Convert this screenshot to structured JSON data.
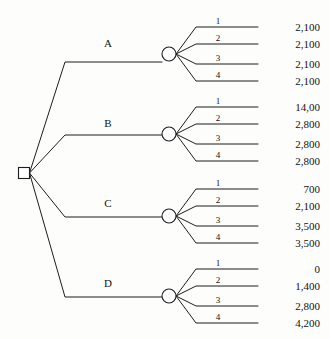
{
  "diagram": {
    "type": "decision-tree",
    "decision_node": {
      "shape": "square",
      "x": 24,
      "y": 173,
      "size": 11
    },
    "alternatives": [
      {
        "label": "A",
        "label_x": 108,
        "label_y": 47,
        "branch_y": 62,
        "chance_node": {
          "shape": "circle",
          "x": 169,
          "y": 54,
          "r": 7
        },
        "outcomes": [
          {
            "state": "1",
            "payoff": "2,100",
            "y": 27
          },
          {
            "state": "2",
            "payoff": "2,100",
            "y": 44
          },
          {
            "state": "3",
            "payoff": "2,100",
            "y": 64
          },
          {
            "state": "4",
            "payoff": "2,100",
            "y": 81
          }
        ]
      },
      {
        "label": "B",
        "label_x": 108,
        "label_y": 127,
        "branch_y": 135,
        "chance_node": {
          "shape": "circle",
          "x": 169,
          "y": 134,
          "r": 7
        },
        "outcomes": [
          {
            "state": "1",
            "payoff": "14,00",
            "y": 107
          },
          {
            "state": "2",
            "payoff": "2,800",
            "y": 124
          },
          {
            "state": "3",
            "payoff": "2,800",
            "y": 144
          },
          {
            "state": "4",
            "payoff": "2,800",
            "y": 161
          }
        ]
      },
      {
        "label": "C",
        "label_x": 108,
        "label_y": 207,
        "branch_y": 217,
        "chance_node": {
          "shape": "circle",
          "x": 169,
          "y": 216,
          "r": 7
        },
        "outcomes": [
          {
            "state": "1",
            "payoff": "700",
            "y": 189
          },
          {
            "state": "2",
            "payoff": "2,100",
            "y": 206
          },
          {
            "state": "3",
            "payoff": "3,500",
            "y": 226
          },
          {
            "state": "4",
            "payoff": "3,500",
            "y": 243
          }
        ]
      },
      {
        "label": "D",
        "label_x": 108,
        "label_y": 287,
        "branch_y": 297,
        "chance_node": {
          "shape": "circle",
          "x": 169,
          "y": 296,
          "r": 7
        },
        "outcomes": [
          {
            "state": "1",
            "payoff": "0",
            "y": 269
          },
          {
            "state": "2",
            "payoff": "1,400",
            "y": 286
          },
          {
            "state": "3",
            "payoff": "2,800",
            "y": 306
          },
          {
            "state": "4",
            "payoff": "4,200",
            "y": 323
          }
        ]
      }
    ],
    "geometry": {
      "trunk_bend_x": 65,
      "alt_line_end_x": 162,
      "outcome_bend_x": 196,
      "outcome_line_end_x": 258,
      "state_label_x": 218,
      "payoff_x": 320
    },
    "colors": {
      "stroke": "#1d1d1d",
      "text": "#131313",
      "node_fill": "#ffffff",
      "background": "#fdfdfc"
    }
  }
}
